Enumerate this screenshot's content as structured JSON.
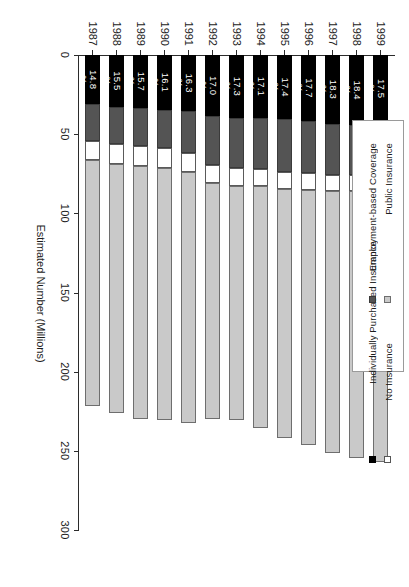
{
  "chart_data": {
    "type": "bar",
    "subtype": "stacked-horizontal",
    "title": "",
    "xlabel": "Estimated Number (Millions)",
    "ylabel": "",
    "orientation": "rotated-90",
    "grid": false,
    "axis_range": [
      0,
      300
    ],
    "axis_ticks": [
      0,
      50,
      100,
      150,
      200,
      250,
      300
    ],
    "axis_tick_labels": [
      "0",
      "50",
      "100",
      "150",
      "200",
      "250",
      "300"
    ],
    "categories": [
      "1987",
      "1988",
      "1989",
      "1990",
      "1991",
      "1992",
      "1993",
      "1994",
      "1995",
      "1996",
      "1997",
      "1998",
      "1999"
    ],
    "series": [
      {
        "name": "No Insurance",
        "color": "#000000",
        "values": [
          31.0,
          32.7,
          33.4,
          34.7,
          35.4,
          38.6,
          39.7,
          39.7,
          40.6,
          41.7,
          43.4,
          44.3,
          42.6
        ]
      },
      {
        "name": "Public Insurance",
        "color": "#545454",
        "values": [
          23.4,
          23.5,
          23.9,
          24.3,
          26.6,
          30.9,
          31.7,
          32.6,
          33.5,
          33.1,
          32.1,
          31.4,
          32.2
        ]
      },
      {
        "name": "Individually Purchased Insurance",
        "color": "#ffffff",
        "values": [
          12.0,
          12.4,
          12.5,
          12.2,
          11.9,
          11.5,
          11.1,
          10.7,
          10.5,
          10.4,
          10.2,
          10.0,
          10.0
        ]
      },
      {
        "name": "Employment-based Coverage",
        "color": "#c9c9c9",
        "values": [
          155.0,
          157.6,
          160.0,
          159.3,
          158.5,
          148.8,
          148.3,
          152.9,
          157.6,
          161.4,
          165.4,
          168.6,
          172.0
        ]
      }
    ],
    "data_labels": {
      "series": "No Insurance",
      "unit": "%",
      "values": [
        "14.8",
        "15.5",
        "15.7",
        "16.1",
        "16.3",
        "17.0",
        "17.3",
        "17.1",
        "17.4",
        "17.7",
        "18.3",
        "18.4",
        "17.5"
      ]
    },
    "legend": {
      "position": "right",
      "entries": [
        {
          "label": "No Insurance",
          "swatch": "#000000"
        },
        {
          "label": "Public Insurance",
          "swatch": "#545454"
        },
        {
          "label": "Individually Purchased Insurance",
          "swatch": "#ffffff"
        },
        {
          "label": "Employment-based Coverage",
          "swatch": "#c9c9c9"
        }
      ]
    }
  }
}
